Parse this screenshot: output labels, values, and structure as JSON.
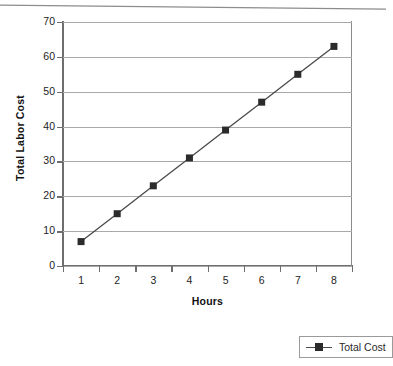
{
  "chart_data": {
    "type": "line",
    "title": "",
    "xlabel": "Hours",
    "ylabel": "Total Labor Cost",
    "categories": [
      "1",
      "2",
      "3",
      "4",
      "5",
      "6",
      "7",
      "8"
    ],
    "x": [
      1,
      2,
      3,
      4,
      5,
      6,
      7,
      8
    ],
    "series": [
      {
        "name": "Total Cost",
        "values": [
          7,
          15,
          23,
          31,
          39,
          47,
          55,
          63
        ],
        "marker": "filled-square",
        "marker_color": "#2b2b2b",
        "line_color": "#4a4a4a"
      }
    ],
    "ylim": [
      0,
      70
    ],
    "ytick_labels": [
      "70",
      "60",
      "50",
      "40",
      "30",
      "20",
      "10",
      "0"
    ],
    "ytick_values": [
      70,
      60,
      50,
      40,
      30,
      20,
      10,
      0
    ],
    "ytick_step": 10,
    "xtick_labels": [
      "1",
      "2",
      "3",
      "4",
      "5",
      "6",
      "7",
      "8"
    ],
    "grid": "horizontal",
    "grid_color": "#a9a9a9",
    "axis_color": "#6e6e6e",
    "legend_position": "bottom-right",
    "legend_entries": [
      "Total Cost"
    ],
    "background_color": "#ffffff"
  },
  "axes": {
    "y_title": "Total Labor Cost",
    "x_title": "Hours"
  },
  "legend": {
    "items": [
      {
        "label": "Total Cost",
        "marker": "square-marker-icon"
      }
    ]
  }
}
